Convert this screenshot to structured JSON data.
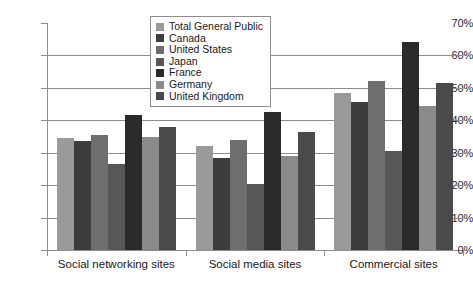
{
  "chart_data": {
    "type": "bar",
    "title": "",
    "xlabel": "",
    "ylabel": "",
    "ylim": [
      0,
      70
    ],
    "ytick_labels": [
      "0%",
      "10%",
      "20%",
      "30%",
      "40%",
      "50%",
      "60%",
      "70%"
    ],
    "ytick_values": [
      0,
      10,
      20,
      30,
      40,
      50,
      60,
      70
    ],
    "grid": true,
    "legend_position": "top-center",
    "categories": [
      "Social networking sites",
      "Social media sites",
      "Commercial sites"
    ],
    "series": [
      {
        "name": "Total General Public",
        "color": "#9a9a9a",
        "values": [
          34.5,
          32.0,
          48.5
        ]
      },
      {
        "name": "Canada",
        "color": "#3d3d3d",
        "values": [
          33.5,
          28.5,
          45.5
        ]
      },
      {
        "name": "United States",
        "color": "#6e6e6e",
        "values": [
          35.5,
          34.0,
          52.0
        ]
      },
      {
        "name": "Japan",
        "color": "#575757",
        "values": [
          26.5,
          20.5,
          30.5
        ]
      },
      {
        "name": "France",
        "color": "#2a2a2a",
        "values": [
          41.5,
          42.5,
          64.0
        ]
      },
      {
        "name": "Germany",
        "color": "#8a8a8a",
        "values": [
          35.0,
          29.0,
          44.5
        ]
      },
      {
        "name": "United Kingdom",
        "color": "#4a4a4a",
        "values": [
          38.0,
          36.5,
          51.5
        ]
      }
    ]
  }
}
